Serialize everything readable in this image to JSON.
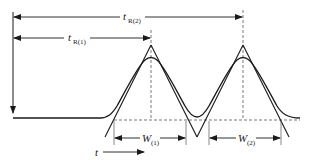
{
  "diagram": {
    "type": "chromatogram-peak-width-measurement",
    "labels": {
      "tR2_main": "t",
      "tR2_sub": "R(2)",
      "tR1_main": "t",
      "tR1_sub": "R(1)",
      "W1_main": "W",
      "W1_sub": "(1)",
      "W2_main": "W",
      "W2_sub": "(2)",
      "time_axis": "t"
    },
    "colors": {
      "line": "#1a1a1a",
      "dashed": "#555555",
      "background": "#ffffff"
    },
    "peaks": [
      {
        "name": "peak-1",
        "center_x": 151,
        "apex_y": 45,
        "curve_top_y": 58
      },
      {
        "name": "peak-2",
        "center_x": 243,
        "apex_y": 45,
        "curve_top_y": 58
      }
    ]
  }
}
